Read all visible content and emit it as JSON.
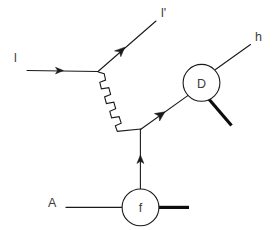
{
  "diagram": {
    "background_color": "#ffffff",
    "line_color": "#1a1a1a",
    "label_color": "#3c3c3c",
    "labels": {
      "incoming_lepton": "l",
      "outgoing_lepton": "l'",
      "nucleus": "A",
      "hadron": "h",
      "fragmentation_blob": "f",
      "decay_blob": "D"
    },
    "elements": {
      "incoming_lepton_line": "incoming lepton l, horizontal arrow to the right",
      "outgoing_lepton_line": "scattered lepton l', arrow up-right",
      "photon_line": "wavy virtual photon propagator, down-right",
      "quark_line": "quark line with arrow, up-right into D blob",
      "gluon_or_parton_line": "vertical line with upward arrow from f blob",
      "nucleus_line": "horizontal line from A into f blob",
      "f_out_thick_line": "thick outgoing line to the right of f blob",
      "d_out_thick_line": "thick outgoing line down-right from D blob",
      "hadron_line": "thin line up-right from D blob to h"
    }
  }
}
